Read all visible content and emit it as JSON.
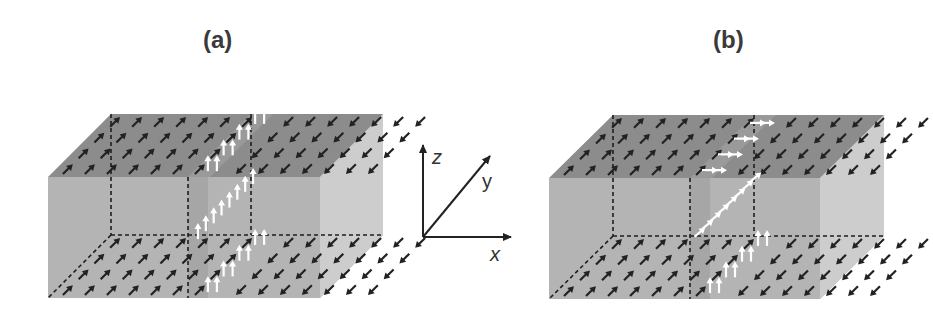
{
  "panels": [
    {
      "label": "(a)",
      "wall_type": "Bloch-like: wall spins point along +z throughout",
      "box": {
        "fx0": 48,
        "fx1": 320,
        "ftop": 177,
        "fbot": 298,
        "dx": 63,
        "dy": -63
      },
      "wall_x_front": 188,
      "left_domain_spin": "+x+y diagonal (up-right arrows)",
      "right_domain_spin": "-x-y diagonal (down-left arrows)",
      "wall_top_arrows": "up",
      "wall_mid_arrows": "up",
      "wall_bottom_arrows": "up"
    },
    {
      "label": "(b)",
      "wall_type": "wall spins rotate from +z at bottom surface to +x at top surface",
      "box": {
        "fx0": 549,
        "fx1": 820,
        "ftop": 178,
        "fbot": 299,
        "dx": 64,
        "dy": -63
      },
      "wall_x_front": 690,
      "left_domain_spin": "+x+y diagonal (up-right arrows)",
      "right_domain_spin": "-x-y diagonal (down-left arrows)",
      "wall_top_arrows": "right",
      "wall_mid_arrows": "tilted",
      "wall_bottom_arrows": "up"
    }
  ],
  "axes": {
    "origin": [
      423,
      237
    ],
    "z_label": "z",
    "y_label": "y",
    "x_label": "x"
  },
  "colors": {
    "top_face": "#8c8c8c",
    "front_face": "#b4b4b4",
    "side_face": "#cdcdcd",
    "bottom_face": "#a8a8a8",
    "wall_strip": "#9a9a9a",
    "dark_arrow": "#222222",
    "light_arrow": "#ffffff",
    "dash": "#1e1e1e"
  }
}
